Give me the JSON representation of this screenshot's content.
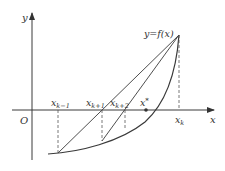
{
  "diagram": {
    "type": "secant-method-illustration",
    "axes": {
      "x_label": "x",
      "y_label": "y",
      "origin_label": "O"
    },
    "curve_label": "y=f(x)",
    "points": {
      "x_k_minus_1": "x",
      "x_k_minus_1_sub": "k−1",
      "x_k_plus_1": "x",
      "x_k_plus_1_sub": "k+1",
      "x_k_plus_2": "x",
      "x_k_plus_2_sub": "k+2",
      "x_star": "x",
      "x_star_sup": "*",
      "x_k": "x",
      "x_k_sub": "k"
    },
    "colors": {
      "line": "#3a3a3a",
      "dashed": "#555555",
      "text": "#333333"
    }
  }
}
